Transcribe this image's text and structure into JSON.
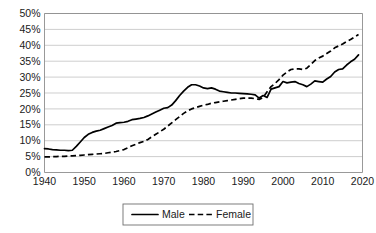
{
  "chart_data": {
    "type": "line",
    "title": "",
    "xlabel": "",
    "ylabel": "",
    "xlim": [
      1940,
      2020
    ],
    "ylim": [
      0,
      0.5
    ],
    "grid": true,
    "legend_position": "bottom",
    "x_ticks": [
      "1940",
      "1950",
      "1960",
      "1970",
      "1980",
      "1990",
      "2000",
      "2010",
      "2020"
    ],
    "x_tick_values": [
      1940,
      1950,
      1960,
      1970,
      1980,
      1990,
      2000,
      2010,
      2020
    ],
    "y_ticks": [
      "0%",
      "5%",
      "10%",
      "15%",
      "20%",
      "25%",
      "30%",
      "35%",
      "40%",
      "45%",
      "50%"
    ],
    "y_tick_values": [
      0,
      5,
      10,
      15,
      20,
      25,
      30,
      35,
      40,
      45,
      50
    ],
    "series": [
      {
        "name": "Male",
        "style": "solid",
        "color": "#000000",
        "x": [
          1940,
          1941,
          1942,
          1943,
          1944,
          1945,
          1946,
          1947,
          1948,
          1949,
          1950,
          1951,
          1952,
          1953,
          1954,
          1955,
          1956,
          1957,
          1958,
          1959,
          1960,
          1961,
          1962,
          1963,
          1964,
          1965,
          1966,
          1967,
          1968,
          1969,
          1970,
          1971,
          1972,
          1973,
          1974,
          1975,
          1976,
          1977,
          1978,
          1979,
          1980,
          1981,
          1982,
          1983,
          1984,
          1985,
          1986,
          1987,
          1988,
          1989,
          1990,
          1991,
          1992,
          1993,
          1994,
          1995,
          1996,
          1997,
          1998,
          1999,
          2000,
          2001,
          2002,
          2003,
          2004,
          2005,
          2006,
          2007,
          2008,
          2009,
          2010,
          2011,
          2012,
          2013,
          2014,
          2015,
          2016,
          2017,
          2018,
          2019
        ],
        "values": [
          7.5,
          7.4,
          7.2,
          7.1,
          7.0,
          7.0,
          6.9,
          7.0,
          8.2,
          9.6,
          11.0,
          12.0,
          12.6,
          13.0,
          13.3,
          13.8,
          14.3,
          14.8,
          15.5,
          15.7,
          15.8,
          16.1,
          16.6,
          16.8,
          17.0,
          17.3,
          17.8,
          18.4,
          19.0,
          19.6,
          20.2,
          20.4,
          21.2,
          22.6,
          24.2,
          25.6,
          26.8,
          27.6,
          27.6,
          27.2,
          26.6,
          26.4,
          26.6,
          26.2,
          25.6,
          25.4,
          25.2,
          25.0,
          25.0,
          24.9,
          24.8,
          24.7,
          24.6,
          24.4,
          23.4,
          24.2,
          23.6,
          26.2,
          26.6,
          27.0,
          28.6,
          28.2,
          28.4,
          28.6,
          28.0,
          27.6,
          27.0,
          27.8,
          28.8,
          28.6,
          28.4,
          29.4,
          30.2,
          31.6,
          32.4,
          32.6,
          33.8,
          34.8,
          35.6,
          37.0
        ]
      },
      {
        "name": "Female",
        "style": "dashed",
        "color": "#000000",
        "x": [
          1940,
          1941,
          1942,
          1943,
          1944,
          1945,
          1946,
          1947,
          1948,
          1949,
          1950,
          1951,
          1952,
          1953,
          1954,
          1955,
          1956,
          1957,
          1958,
          1959,
          1960,
          1961,
          1962,
          1963,
          1964,
          1965,
          1966,
          1967,
          1968,
          1969,
          1970,
          1971,
          1972,
          1973,
          1974,
          1975,
          1976,
          1977,
          1978,
          1979,
          1980,
          1981,
          1982,
          1983,
          1984,
          1985,
          1986,
          1987,
          1988,
          1989,
          1990,
          1991,
          1992,
          1993,
          1994,
          1995,
          1996,
          1997,
          1998,
          1999,
          2000,
          2001,
          2002,
          2003,
          2004,
          2005,
          2006,
          2007,
          2008,
          2009,
          2010,
          2011,
          2012,
          2013,
          2014,
          2015,
          2016,
          2017,
          2018,
          2019
        ],
        "values": [
          4.9,
          4.9,
          5.0,
          5.0,
          5.1,
          5.1,
          5.2,
          5.2,
          5.3,
          5.4,
          5.5,
          5.6,
          5.7,
          5.8,
          5.9,
          6.0,
          6.2,
          6.4,
          6.6,
          6.9,
          7.2,
          7.8,
          8.4,
          8.9,
          9.4,
          9.8,
          10.4,
          11.2,
          12.0,
          12.8,
          13.6,
          14.6,
          15.6,
          16.6,
          17.6,
          18.6,
          19.4,
          20.0,
          20.4,
          20.8,
          21.2,
          21.4,
          21.8,
          22.0,
          22.2,
          22.4,
          22.6,
          22.8,
          23.0,
          23.2,
          23.4,
          23.4,
          23.4,
          23.2,
          23.0,
          23.6,
          25.4,
          27.0,
          28.0,
          29.2,
          30.6,
          31.6,
          32.4,
          32.6,
          32.6,
          32.4,
          32.8,
          34.0,
          35.2,
          36.0,
          36.6,
          37.4,
          38.2,
          39.2,
          39.8,
          40.4,
          41.2,
          41.8,
          42.6,
          43.4
        ]
      }
    ]
  },
  "legend": {
    "items": [
      {
        "label": "Male",
        "style": "solid"
      },
      {
        "label": "Female",
        "style": "dashed"
      }
    ]
  }
}
